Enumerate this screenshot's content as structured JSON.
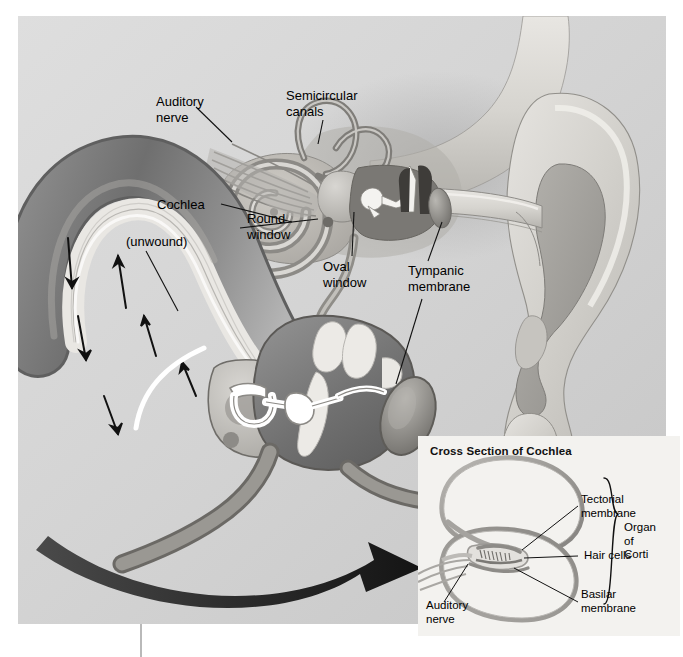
{
  "figure": {
    "type": "anatomical-diagram",
    "background_color": "#d4d4d4",
    "page_color": "#ffffff"
  },
  "labels": {
    "auditory_nerve": "Auditory\nnerve",
    "semicircular_canals": "Semicircular\ncanals",
    "cochlea": "Cochlea",
    "unwound": "(unwound)",
    "round_window": "Round\nwindow",
    "oval_window": "Oval\nwindow",
    "tympanic_membrane": "Tympanic\nmembrane"
  },
  "inset": {
    "title": "Cross Section of Cochlea",
    "background_color": "#f3f2ef",
    "labels": {
      "tectorial_membrane": "Tectorial\nmembrane",
      "hair_cells": "Hair cells",
      "basilar_membrane": "Basilar\nmembrane",
      "auditory_nerve": "Auditory\nnerve",
      "organ_of_corti": "Organ\nof\nCorti"
    }
  },
  "colors": {
    "outline": "#5f5f5f",
    "tissue_mid": "#a7a7a7",
    "tissue_dark": "#6e6e6e",
    "tissue_light": "#e6e6e6",
    "arrow_black": "#111111",
    "arrow_white": "#ffffff"
  }
}
